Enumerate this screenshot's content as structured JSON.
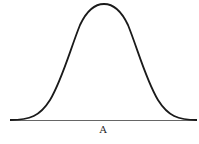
{
  "figure": {
    "type": "normal-distribution-curve",
    "baseline_label": "A",
    "stroke_color": "#1a1a1a",
    "baseline_color": "#555555"
  }
}
